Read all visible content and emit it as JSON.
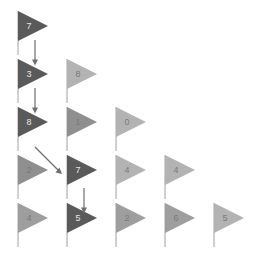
{
  "scene": {
    "title": "Flag Grid Path Diagram",
    "background_color": "#ffffff",
    "width": 263,
    "height": 268
  },
  "palette": {
    "dark": "#5a5a5a",
    "mid": "#8f8f8f",
    "midlight": "#9e9e9e",
    "light": "#b3b3b3",
    "pole": "#c8c8c8",
    "arrow": "#6e6e6e",
    "digit_on_dark": "#e8e8e8",
    "digit_on_light": "#7a7a7a"
  },
  "grid": {
    "origin_x": 14,
    "origin_y": 10,
    "col_step": 49,
    "row_step": 48
  },
  "rows": [
    {
      "index": 0,
      "flags": [
        {
          "value": "7",
          "tone": "dark",
          "col": 0,
          "row": 0
        }
      ]
    },
    {
      "index": 1,
      "flags": [
        {
          "value": "3",
          "tone": "dark",
          "col": 0,
          "row": 1
        },
        {
          "value": "8",
          "tone": "light",
          "col": 1,
          "row": 1
        }
      ]
    },
    {
      "index": 2,
      "flags": [
        {
          "value": "8",
          "tone": "dark",
          "col": 0,
          "row": 2
        },
        {
          "value": "1",
          "tone": "mid",
          "col": 1,
          "row": 2
        },
        {
          "value": "0",
          "tone": "light",
          "col": 2,
          "row": 2
        }
      ]
    },
    {
      "index": 3,
      "flags": [
        {
          "value": "2",
          "tone": "mid",
          "col": 0,
          "row": 3
        },
        {
          "value": "7",
          "tone": "dark",
          "col": 1,
          "row": 3
        },
        {
          "value": "4",
          "tone": "light",
          "col": 2,
          "row": 3
        },
        {
          "value": "4",
          "tone": "light",
          "col": 3,
          "row": 3
        }
      ]
    },
    {
      "index": 4,
      "flags": [
        {
          "value": "4",
          "tone": "midlight",
          "col": 0,
          "row": 4
        },
        {
          "value": "5",
          "tone": "dark",
          "col": 1,
          "row": 4
        },
        {
          "value": "2",
          "tone": "midlight",
          "col": 2,
          "row": 4
        },
        {
          "value": "6",
          "tone": "midlight",
          "col": 3,
          "row": 4
        },
        {
          "value": "5",
          "tone": "light",
          "col": 4,
          "row": 4
        }
      ]
    }
  ],
  "flags": [
    {
      "id": "flag-r0c0",
      "value": "7",
      "tone": "dark",
      "x": 14,
      "y": 10
    },
    {
      "id": "flag-r1c0",
      "value": "3",
      "tone": "dark",
      "x": 14,
      "y": 58
    },
    {
      "id": "flag-r1c1",
      "value": "8",
      "tone": "light",
      "x": 63,
      "y": 58
    },
    {
      "id": "flag-r2c0",
      "value": "8",
      "tone": "dark",
      "x": 14,
      "y": 106
    },
    {
      "id": "flag-r2c1",
      "value": "1",
      "tone": "mid",
      "x": 63,
      "y": 106
    },
    {
      "id": "flag-r2c2",
      "value": "0",
      "tone": "light",
      "x": 112,
      "y": 106
    },
    {
      "id": "flag-r3c0",
      "value": "2",
      "tone": "mid",
      "x": 14,
      "y": 154
    },
    {
      "id": "flag-r3c1",
      "value": "7",
      "tone": "dark",
      "x": 63,
      "y": 154
    },
    {
      "id": "flag-r3c2",
      "value": "4",
      "tone": "light",
      "x": 112,
      "y": 154
    },
    {
      "id": "flag-r3c3",
      "value": "4",
      "tone": "light",
      "x": 161,
      "y": 154
    },
    {
      "id": "flag-r4c0",
      "value": "4",
      "tone": "midlight",
      "x": 14,
      "y": 202
    },
    {
      "id": "flag-r4c1",
      "value": "5",
      "tone": "dark",
      "x": 63,
      "y": 202
    },
    {
      "id": "flag-r4c2",
      "value": "2",
      "tone": "midlight",
      "x": 112,
      "y": 202
    },
    {
      "id": "flag-r4c3",
      "value": "6",
      "tone": "midlight",
      "x": 161,
      "y": 202
    },
    {
      "id": "flag-r4c4",
      "value": "5",
      "tone": "light",
      "x": 210,
      "y": 202
    }
  ],
  "arrows": [
    {
      "id": "arrow-1",
      "direction": "down",
      "from": "flag-r0c0",
      "to": "flag-r1c0",
      "x": 30,
      "y": 40,
      "length": 22
    },
    {
      "id": "arrow-2",
      "direction": "down",
      "from": "flag-r1c0",
      "to": "flag-r2c0",
      "x": 30,
      "y": 88,
      "length": 22
    },
    {
      "id": "arrow-3",
      "direction": "down-right",
      "from": "flag-r2c0",
      "to": "flag-r3c1",
      "x": 34,
      "y": 146,
      "length": 26
    },
    {
      "id": "arrow-4",
      "direction": "down",
      "from": "flag-r3c1",
      "to": "flag-r4c1",
      "x": 79,
      "y": 188,
      "length": 22
    }
  ],
  "path": {
    "label": "highlighted-path",
    "sequence": [
      "7",
      "3",
      "8",
      "7",
      "5"
    ]
  }
}
